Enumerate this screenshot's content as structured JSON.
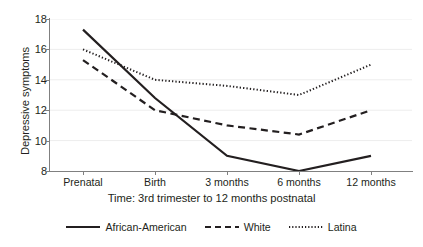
{
  "chart_data": {
    "type": "line",
    "title": "",
    "xlabel": "Time: 3rd trimester to 12 months postnatal",
    "ylabel": "Depressive symptoms",
    "categories": [
      "Prenatal",
      "Birth",
      "3 months",
      "6 months",
      "12 months"
    ],
    "ylim": [
      8,
      18
    ],
    "yticks": [
      8,
      10,
      12,
      14,
      16,
      18
    ],
    "grid": "horizontal-faint",
    "legend_position": "bottom",
    "series": [
      {
        "name": "African-American",
        "style": "solid",
        "color": "#231f20",
        "values": [
          17.3,
          12.8,
          9.0,
          8.0,
          9.0
        ]
      },
      {
        "name": "White",
        "style": "dashed",
        "color": "#231f20",
        "values": [
          15.3,
          12.0,
          11.0,
          10.4,
          12.0
        ]
      },
      {
        "name": "Latina",
        "style": "dotted",
        "color": "#231f20",
        "values": [
          16.0,
          14.0,
          13.6,
          13.0,
          15.0
        ]
      }
    ]
  },
  "axis": {
    "y_tick_labels": [
      "18",
      "16",
      "14",
      "12",
      "10",
      "8"
    ],
    "x_tick_labels": [
      "Prenatal",
      "Birth",
      "3 months",
      "6 months",
      "12 months"
    ],
    "y_title": "Depressive symptoms",
    "x_title": "Time: 3rd trimester to 12 months postnatal"
  },
  "legend": {
    "items": [
      {
        "label": "African-American",
        "style": "solid"
      },
      {
        "label": "White",
        "style": "dashed"
      },
      {
        "label": "Latina",
        "style": "dotted"
      }
    ]
  },
  "colors": {
    "ink": "#231f20",
    "axis": "#808080",
    "grid": "#ededed",
    "background": "#ffffff"
  }
}
